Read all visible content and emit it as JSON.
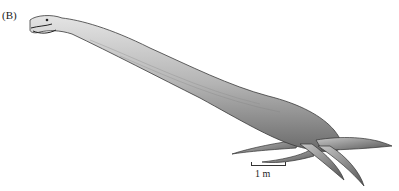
{
  "figure": {
    "panel_label": "(B)",
    "scale_bar": {
      "label": "1 m"
    }
  },
  "colors": {
    "background": "#ffffff",
    "body_light": "#d6d6d6",
    "body_mid": "#9a9a9a",
    "body_dark": "#3a3a3a"
  }
}
